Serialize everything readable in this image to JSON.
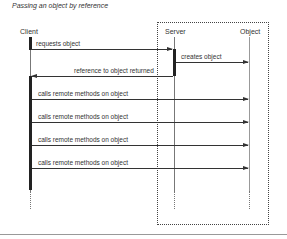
{
  "title": "Passing an object by reference",
  "actors": {
    "client": "Client",
    "server": "Server",
    "object": "Object"
  },
  "messages": [
    {
      "label": "requests object",
      "from": "Client",
      "to": "Server"
    },
    {
      "label": "creates object",
      "from": "Server",
      "to": "Object"
    },
    {
      "label": "reference to object returned",
      "from": "Server",
      "to": "Client"
    },
    {
      "label": "calls remote methods on object",
      "from": "Client",
      "to": "Object"
    },
    {
      "label": "calls remote methods on object",
      "from": "Client",
      "to": "Object"
    },
    {
      "label": "calls remote methods on object",
      "from": "Client",
      "to": "Object"
    },
    {
      "label": "calls remote methods on object",
      "from": "Client",
      "to": "Object"
    }
  ]
}
